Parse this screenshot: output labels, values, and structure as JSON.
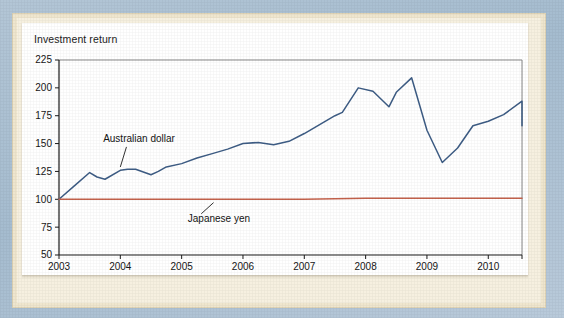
{
  "figure": {
    "title": "Investment return",
    "frame_color": "#aabfd2",
    "mat_color": "#efe6ce",
    "panel_color": "#ffffff"
  },
  "chart_data": {
    "type": "line",
    "title": "Investment return",
    "xlabel": "",
    "ylabel": "",
    "xlim": [
      2003,
      2010.55
    ],
    "ylim": [
      50,
      225
    ],
    "xticks": [
      2003,
      2004,
      2005,
      2006,
      2007,
      2008,
      2009,
      2010
    ],
    "xtick_labels": [
      "2003",
      "2004",
      "2005",
      "2006",
      "2007",
      "2008",
      "2009",
      "2010"
    ],
    "yticks": [
      50,
      75,
      100,
      125,
      150,
      175,
      200,
      225
    ],
    "ytick_labels": [
      "50",
      "75",
      "100",
      "125",
      "150",
      "175",
      "200",
      "225"
    ],
    "grid": false,
    "legend_position": "inline-annotations",
    "series": [
      {
        "name": "Australian dollar",
        "color": "#3d5c84",
        "x": [
          2003.0,
          2003.25,
          2003.5,
          2003.62,
          2003.75,
          2004.0,
          2004.12,
          2004.25,
          2004.5,
          2004.62,
          2004.75,
          2005.0,
          2005.25,
          2005.5,
          2005.75,
          2006.0,
          2006.25,
          2006.5,
          2006.75,
          2007.0,
          2007.25,
          2007.5,
          2007.62,
          2007.88,
          2008.12,
          2008.38,
          2008.5,
          2008.75,
          2009.0,
          2009.25,
          2009.5,
          2009.75,
          2010.0,
          2010.25,
          2010.55
        ],
        "values": [
          100,
          112,
          124,
          120,
          118,
          126,
          127,
          127,
          122,
          125,
          129,
          132,
          137,
          141,
          145,
          150,
          151,
          149,
          152,
          159,
          167,
          175,
          178,
          200,
          197,
          183,
          196,
          209,
          162,
          133,
          146,
          166,
          170,
          176,
          188
        ],
        "end_value": 166
      },
      {
        "name": "Japanese yen",
        "color": "#c2614b",
        "x": [
          2003.0,
          2004.0,
          2005.0,
          2006.0,
          2007.0,
          2008.0,
          2009.0,
          2010.0,
          2010.55
        ],
        "values": [
          100,
          100,
          100,
          100,
          100,
          101,
          101,
          101,
          101
        ]
      }
    ],
    "annotations": [
      {
        "text": "Australian dollar",
        "label_x": 2003.72,
        "label_y": 151,
        "leader_from": [
          2004.1,
          147
        ],
        "leader_to": [
          2004.0,
          129
        ]
      },
      {
        "text": "Japanese yen",
        "label_x": 2005.1,
        "label_y": 80,
        "leader_from": [
          2005.32,
          87
        ],
        "leader_to": [
          2005.52,
          97
        ]
      }
    ]
  }
}
